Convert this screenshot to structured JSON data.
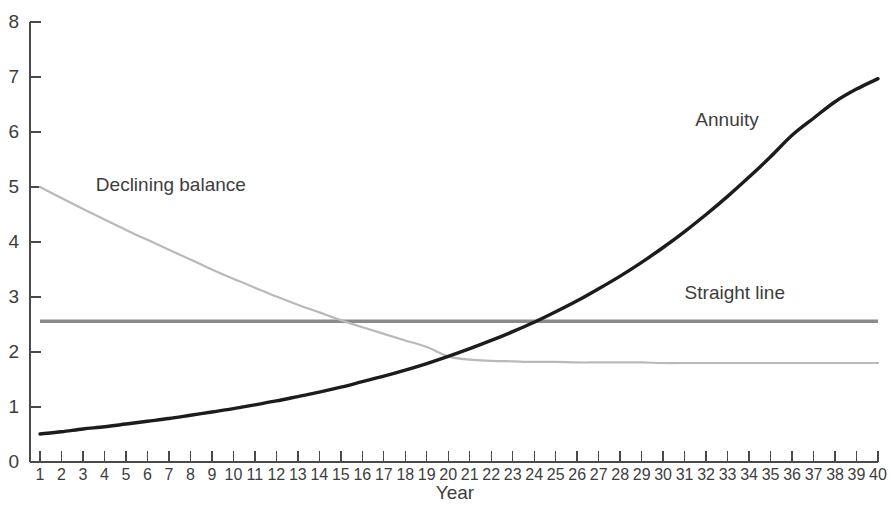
{
  "chart": {
    "background_color": "#ffffff",
    "axis_color": "#4a4a4a",
    "text_color": "#3d3d3d"
  },
  "chart_data": {
    "type": "line",
    "title": "",
    "subtitle": "",
    "xlabel": "Year",
    "ylabel": "",
    "xlim": [
      1,
      40
    ],
    "ylim": [
      0,
      8
    ],
    "grid": false,
    "legend_position": "inline-annotations",
    "x_tick_labels": [
      "1",
      "2",
      "3",
      "4",
      "5",
      "6",
      "7",
      "8",
      "9",
      "10",
      "11",
      "12",
      "13",
      "14",
      "15",
      "16",
      "17",
      "18",
      "19",
      "20",
      "21",
      "22",
      "23",
      "24",
      "25",
      "26",
      "27",
      "28",
      "29",
      "30",
      "31",
      "32",
      "33",
      "34",
      "35",
      "36",
      "37",
      "38",
      "39",
      "40"
    ],
    "y_tick_labels": [
      "0",
      "1",
      "2",
      "3",
      "4",
      "5",
      "6",
      "7",
      "8"
    ],
    "x": [
      1,
      2,
      3,
      4,
      5,
      6,
      7,
      8,
      9,
      10,
      11,
      12,
      13,
      14,
      15,
      16,
      17,
      18,
      19,
      20,
      21,
      22,
      23,
      24,
      25,
      26,
      27,
      28,
      29,
      30,
      31,
      32,
      33,
      34,
      35,
      36,
      37,
      38,
      39,
      40
    ],
    "series": [
      {
        "name": "Annuity",
        "color": "#1c1c1c",
        "line_width": 3.4,
        "label_anchor_x": 31.5,
        "label_anchor_y": 6.2,
        "values": [
          0.51,
          0.55,
          0.6,
          0.64,
          0.69,
          0.74,
          0.79,
          0.85,
          0.91,
          0.97,
          1.04,
          1.11,
          1.19,
          1.27,
          1.36,
          1.46,
          1.56,
          1.67,
          1.79,
          1.92,
          2.06,
          2.21,
          2.37,
          2.54,
          2.73,
          2.93,
          3.15,
          3.38,
          3.63,
          3.9,
          4.19,
          4.5,
          4.83,
          5.18,
          5.55,
          5.94,
          6.25,
          6.55,
          6.78,
          6.97
        ]
      },
      {
        "name": "Declining balance",
        "color": "#b9b9b9",
        "line_width": 2.2,
        "label_anchor_x": 3.6,
        "label_anchor_y": 5.02,
        "values": [
          5.0,
          4.8,
          4.6,
          4.41,
          4.22,
          4.04,
          3.86,
          3.68,
          3.5,
          3.33,
          3.17,
          3.01,
          2.86,
          2.72,
          2.58,
          2.45,
          2.33,
          2.21,
          2.09,
          1.92,
          1.86,
          1.84,
          1.83,
          1.82,
          1.82,
          1.81,
          1.81,
          1.81,
          1.81,
          1.8,
          1.8,
          1.8,
          1.8,
          1.8,
          1.8,
          1.8,
          1.8,
          1.8,
          1.8,
          1.8
        ]
      },
      {
        "name": "Straight line",
        "color": "#8a8a8a",
        "line_width": 3.6,
        "label_anchor_x": 31.0,
        "label_anchor_y": 3.05,
        "values": [
          2.56,
          2.56,
          2.56,
          2.56,
          2.56,
          2.56,
          2.56,
          2.56,
          2.56,
          2.56,
          2.56,
          2.56,
          2.56,
          2.56,
          2.56,
          2.56,
          2.56,
          2.56,
          2.56,
          2.56,
          2.56,
          2.56,
          2.56,
          2.56,
          2.56,
          2.56,
          2.56,
          2.56,
          2.56,
          2.56,
          2.56,
          2.56,
          2.56,
          2.56,
          2.56,
          2.56,
          2.56,
          2.56,
          2.56,
          2.56
        ]
      }
    ]
  }
}
